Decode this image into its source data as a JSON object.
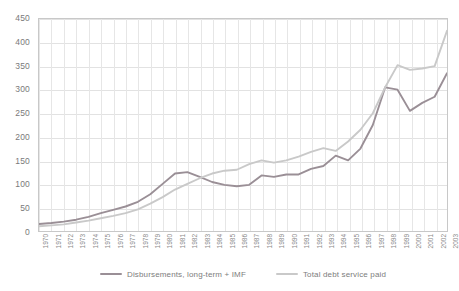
{
  "chart_data": {
    "type": "line",
    "title": "",
    "subtitle": "",
    "xlabel": "",
    "ylabel": "",
    "ylim": [
      0,
      450
    ],
    "ytick_step": 50,
    "yticks": [
      450,
      400,
      350,
      300,
      250,
      200,
      150,
      100,
      50,
      0
    ],
    "grid": true,
    "grid_horizontal": true,
    "grid_vertical": true,
    "legend_position": "bottom",
    "categories": [
      "1970",
      "1971",
      "1972",
      "1973",
      "1974",
      "1975",
      "1976",
      "1977",
      "1978",
      "1979",
      "1980",
      "1981",
      "1982",
      "1983",
      "1984",
      "1985",
      "1986",
      "1987",
      "1988",
      "1989",
      "1990",
      "1991",
      "1992",
      "1993",
      "1994",
      "1995",
      "1996",
      "1997",
      "1998",
      "1999",
      "2000",
      "2001",
      "2002",
      "2003"
    ],
    "series": [
      {
        "name": "Disbursements, long-term + IMF",
        "color": "#9a8f96",
        "values": [
          15,
          17,
          20,
          24,
          30,
          38,
          45,
          52,
          62,
          78,
          100,
          122,
          125,
          115,
          104,
          98,
          95,
          98,
          118,
          115,
          120,
          120,
          132,
          138,
          160,
          150,
          175,
          225,
          305,
          300,
          255,
          272,
          285,
          335
        ]
      },
      {
        "name": "Total debt service paid",
        "color": "#c9c9c9",
        "values": [
          10,
          12,
          14,
          18,
          22,
          27,
          32,
          38,
          46,
          58,
          72,
          88,
          100,
          112,
          122,
          128,
          130,
          142,
          150,
          145,
          150,
          158,
          168,
          176,
          170,
          190,
          215,
          250,
          305,
          352,
          342,
          345,
          350,
          425
        ]
      }
    ]
  },
  "legend": {
    "entries": [
      {
        "label": "Disbursements, long-term + IMF"
      },
      {
        "label": "Total debt service paid"
      }
    ]
  },
  "axes": {
    "y_labels": [
      "450",
      "400",
      "350",
      "300",
      "250",
      "200",
      "150",
      "100",
      "50",
      "0"
    ],
    "x_labels": [
      "1970",
      "1971",
      "1972",
      "1973",
      "1974",
      "1975",
      "1976",
      "1977",
      "1978",
      "1979",
      "1980",
      "1981",
      "1982",
      "1983",
      "1984",
      "1985",
      "1986",
      "1987",
      "1988",
      "1989",
      "1990",
      "1991",
      "1992",
      "1993",
      "1994",
      "1995",
      "1996",
      "1997",
      "1998",
      "1999",
      "2000",
      "2001",
      "2002",
      "2003"
    ]
  },
  "colors": {
    "series_1": "#9a8f96",
    "series_2": "#c9c9c9",
    "grid": "#e2e2e2",
    "border": "#c8c8c8",
    "text": "#7a7a7a",
    "background": "#ffffff"
  }
}
